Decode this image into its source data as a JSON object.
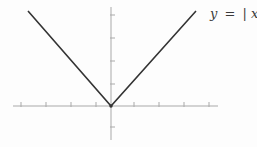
{
  "figure": {
    "label_text": "y = |x|",
    "label_parts": {
      "y": "y",
      "eq": "=",
      "bar_left": "|",
      "x": "x",
      "bar_right": "|"
    },
    "colors": {
      "axis": "#a9a9a9",
      "curve": "#343434",
      "label": "#3a3a3a",
      "background": "#fdfdfd"
    },
    "geometry": {
      "width": 257,
      "height": 147,
      "origin": {
        "x": 111,
        "y": 106
      },
      "x_axis": {
        "start": 13,
        "end": 218,
        "ticks": [
          21,
          46,
          71,
          96,
          134,
          159,
          184,
          209
        ],
        "tick_len_up": 4,
        "tick_len_down": 1
      },
      "y_axis": {
        "start": 7,
        "end": 140,
        "ticks": [
          15,
          38,
          61,
          84,
          127
        ],
        "tick_len_left": 1,
        "tick_len_right": 4
      },
      "curve_points": [
        [
          28,
          11
        ],
        [
          111,
          106
        ],
        [
          196,
          11
        ]
      ],
      "vertex_dot_radius": 1.7,
      "label_pos": {
        "x": 210,
        "y": 7
      }
    }
  },
  "chart_data": {
    "type": "line",
    "title": "",
    "xlabel": "",
    "ylabel": "",
    "series": [
      {
        "name": "y = |x|",
        "x": [
          -3.3,
          0,
          3.4
        ],
        "y": [
          3.3,
          0,
          3.4
        ]
      }
    ],
    "xlim": [
      -3.9,
      4.3
    ],
    "ylim": [
      -1.5,
      4.3
    ],
    "x_ticks": [
      -3.6,
      -2.6,
      -1.6,
      -0.6,
      0.9,
      1.9,
      2.9,
      3.9
    ],
    "y_ticks": [
      -0.9,
      1.0,
      2.0,
      3.0,
      4.0
    ],
    "tick_labels_shown": false,
    "grid": false,
    "legend": "none",
    "annotations": [
      {
        "text": "y = |x|",
        "location": "top-right, beside end of right branch"
      }
    ]
  }
}
